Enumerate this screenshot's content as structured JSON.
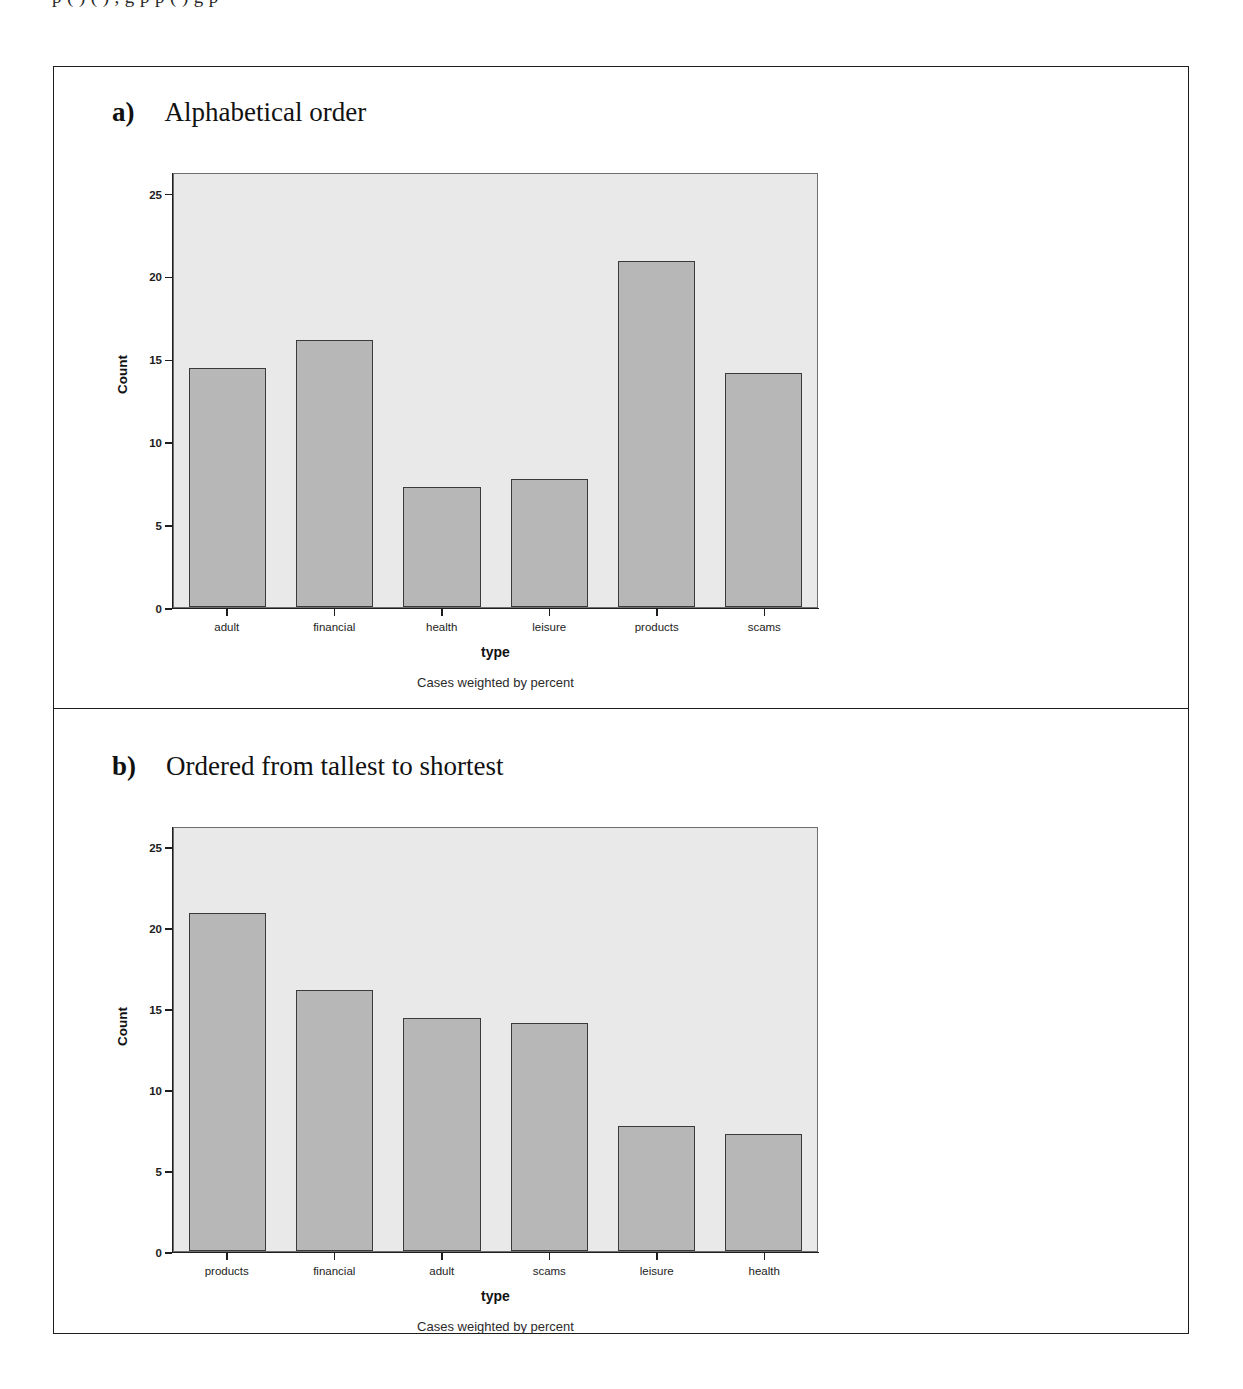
{
  "page": {
    "top_cut_text": "p           ( )     ( )             ,              g   p      p    ( )                              g   p"
  },
  "figure": {
    "panels": [
      {
        "letter": "a)",
        "title": "Alphabetical order",
        "chart": {
          "type": "bar",
          "title": "",
          "xlabel": "type",
          "ylabel": "Count",
          "footnote": "Cases weighted by percent",
          "ylim": [
            0,
            26.3
          ],
          "yticks": [
            0,
            5,
            10,
            15,
            20,
            25
          ],
          "grid": false,
          "legend": "none",
          "categories": [
            "adult",
            "financial",
            "health",
            "leisure",
            "products",
            "scams"
          ],
          "values": [
            14.5,
            16.2,
            7.3,
            7.8,
            21.0,
            14.2
          ]
        }
      },
      {
        "letter": "b)",
        "title": "Ordered from tallest to shortest",
        "chart": {
          "type": "bar",
          "title": "",
          "xlabel": "type",
          "ylabel": "Count",
          "footnote": "Cases weighted by percent",
          "ylim": [
            0,
            26.3
          ],
          "yticks": [
            0,
            5,
            10,
            15,
            20,
            25
          ],
          "grid": false,
          "legend": "none",
          "categories": [
            "products",
            "financial",
            "adult",
            "scams",
            "leisure",
            "health"
          ],
          "values": [
            21.0,
            16.2,
            14.5,
            14.2,
            7.8,
            7.3
          ]
        }
      }
    ]
  },
  "chart_data": [
    {
      "type": "bar",
      "title": "a) Alphabetical order",
      "categories": [
        "adult",
        "financial",
        "health",
        "leisure",
        "products",
        "scams"
      ],
      "values": [
        14.5,
        16.2,
        7.3,
        7.8,
        21.0,
        14.2
      ],
      "xlabel": "type",
      "ylabel": "Count",
      "ylim": [
        0,
        26.3
      ],
      "yticks": [
        0,
        5,
        10,
        15,
        20,
        25
      ],
      "annotations": [
        "Cases weighted by percent"
      ],
      "grid": false,
      "legend": "none"
    },
    {
      "type": "bar",
      "title": "b) Ordered from tallest to shortest",
      "categories": [
        "products",
        "financial",
        "adult",
        "scams",
        "leisure",
        "health"
      ],
      "values": [
        21.0,
        16.2,
        14.5,
        14.2,
        7.8,
        7.3
      ],
      "xlabel": "type",
      "ylabel": "Count",
      "ylim": [
        0,
        26.3
      ],
      "yticks": [
        0,
        5,
        10,
        15,
        20,
        25
      ],
      "annotations": [
        "Cases weighted by percent"
      ],
      "grid": false,
      "legend": "none"
    }
  ],
  "colors": {
    "bar_fill": "#b7b7b7",
    "bar_edge": "#3a3a3a",
    "plot_background": "#e9e9e9",
    "axis": "#1d1d1d",
    "frame": "#1d1d1d"
  }
}
